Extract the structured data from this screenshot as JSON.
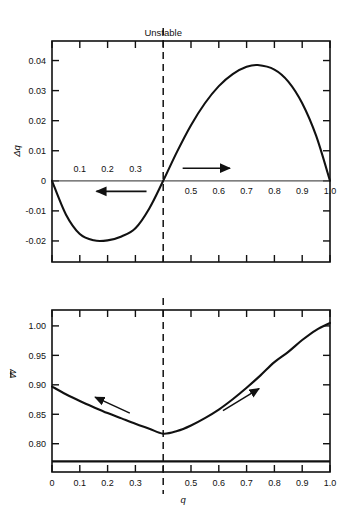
{
  "figure": {
    "background": "#ffffff",
    "ink": "#000000",
    "annotation_unstable": "Unstable",
    "unstable_q": 0.4
  },
  "chart_data": [
    {
      "id": "delta-q-panel",
      "type": "line",
      "title": "Unstable",
      "xlabel": "",
      "ylabel": "Δq",
      "xlim": [
        0,
        1.0
      ],
      "ylim": [
        -0.027,
        0.0465
      ],
      "grid": false,
      "legend": null,
      "x_ticks": [
        0,
        0.1,
        0.2,
        0.3,
        0.4,
        0.5,
        0.6,
        0.7,
        0.8,
        0.9,
        1.0
      ],
      "x_tick_labels_above_axis": [
        "0.1",
        "0.2",
        "0.3"
      ],
      "x_tick_labels_above_values": [
        0.1,
        0.2,
        0.3
      ],
      "x_tick_labels_below_axis": [
        "0.5",
        "0.6",
        "0.7",
        "0.8",
        "0.9",
        "1.0"
      ],
      "x_tick_labels_below_values": [
        0.5,
        0.6,
        0.7,
        0.8,
        0.9,
        1.0
      ],
      "y_ticks": [
        -0.02,
        -0.01,
        0,
        0.01,
        0.02,
        0.03,
        0.04
      ],
      "y_tick_labels": [
        "-0.02",
        "-0.01",
        "0",
        "0.01",
        "0.02",
        "0.03",
        "0.04"
      ],
      "series": [
        {
          "name": "Δq(q)",
          "x": [
            0.0,
            0.05,
            0.1,
            0.15,
            0.2,
            0.25,
            0.3,
            0.35,
            0.4,
            0.45,
            0.5,
            0.55,
            0.6,
            0.65,
            0.7,
            0.74,
            0.8,
            0.85,
            0.9,
            0.95,
            1.0
          ],
          "values": [
            0.0,
            -0.0112,
            -0.0177,
            -0.0198,
            -0.0198,
            -0.0185,
            -0.0158,
            -0.0092,
            0.0,
            0.0097,
            0.0185,
            0.0258,
            0.0315,
            0.0355,
            0.0379,
            0.0385,
            0.037,
            0.033,
            0.0258,
            0.015,
            0.0
          ]
        }
      ],
      "zero_line": 0,
      "annotations": [
        {
          "kind": "dashed-vline",
          "x": 0.4,
          "label": "Unstable"
        },
        {
          "kind": "arrow",
          "direction": "left",
          "x_from": 0.34,
          "x_to": 0.16,
          "y": -0.0035
        },
        {
          "kind": "arrow",
          "direction": "right",
          "x_from": 0.47,
          "x_to": 0.64,
          "y": 0.0042
        }
      ]
    },
    {
      "id": "mean-fitness-panel",
      "type": "line",
      "title": "",
      "xlabel": "q",
      "ylabel": "W̄",
      "xlim": [
        0,
        1.0
      ],
      "ylim": [
        0.752,
        1.027
      ],
      "grid": false,
      "legend": null,
      "x_ticks": [
        0,
        0.1,
        0.2,
        0.3,
        0.4,
        0.5,
        0.6,
        0.7,
        0.8,
        0.9,
        1.0
      ],
      "x_tick_labels": [
        "0",
        "0.1",
        "0.2",
        "0.3",
        "",
        "0.5",
        "0.6",
        "0.7",
        "0.8",
        "0.9",
        "1.0"
      ],
      "y_ticks": [
        0.8,
        0.85,
        0.9,
        0.95,
        1.0
      ],
      "y_tick_labels": [
        "0.80",
        "0.85",
        "0.90",
        "0.95",
        "1.00"
      ],
      "series": [
        {
          "name": "W̄(q)",
          "x": [
            0.0,
            0.05,
            0.1,
            0.15,
            0.2,
            0.25,
            0.3,
            0.35,
            0.4,
            0.45,
            0.5,
            0.55,
            0.6,
            0.65,
            0.7,
            0.75,
            0.8,
            0.85,
            0.9,
            0.95,
            1.0
          ],
          "values": [
            0.897,
            0.884,
            0.8725,
            0.862,
            0.852,
            0.843,
            0.834,
            0.8255,
            0.817,
            0.8215,
            0.831,
            0.8435,
            0.858,
            0.8755,
            0.895,
            0.916,
            0.9385,
            0.956,
            0.976,
            0.993,
            1.005
          ]
        }
      ],
      "reference_line_y": 0.77,
      "annotations": [
        {
          "kind": "dashed-vline",
          "x": 0.4
        },
        {
          "kind": "arrow",
          "direction": "upleft",
          "x_from": 0.28,
          "y_from": 0.852,
          "x_to": 0.155,
          "y_to": 0.879
        },
        {
          "kind": "arrow",
          "direction": "upright",
          "x_from": 0.615,
          "y_from": 0.856,
          "x_to": 0.745,
          "y_to": 0.8935
        }
      ]
    }
  ]
}
